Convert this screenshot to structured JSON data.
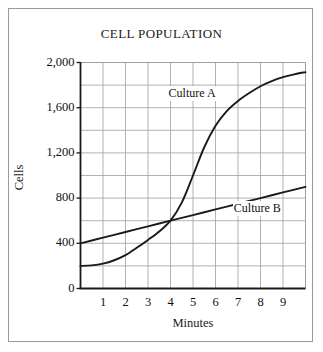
{
  "chart_data": {
    "type": "line",
    "title": "CELL POPULATION",
    "xlabel": "Minutes",
    "ylabel": "Cells",
    "xlim": [
      0,
      10
    ],
    "ylim": [
      0,
      2000
    ],
    "grid": true,
    "x_tick_labels": [
      "1",
      "2",
      "3",
      "4",
      "5",
      "6",
      "7",
      "8",
      "9"
    ],
    "x_tick_values": [
      1,
      2,
      3,
      4,
      5,
      6,
      7,
      8,
      9
    ],
    "x_gridline_values": [
      0,
      1,
      2,
      3,
      4,
      5,
      6,
      7,
      8,
      9,
      10
    ],
    "y_tick_labels": [
      "0",
      "400",
      "800",
      "1,200",
      "1,600",
      "2,000"
    ],
    "y_tick_values": [
      0,
      400,
      800,
      1200,
      1600,
      2000
    ],
    "y_gridline_values": [
      0,
      200,
      400,
      600,
      800,
      1000,
      1200,
      1400,
      1600,
      1800,
      2000
    ],
    "legend_position": "inline-annotation",
    "line_color": "#1a1a1a",
    "grid_color": "#9e9e9e",
    "axis_color": "#1a1a1a",
    "background_color": "#ffffff",
    "series": [
      {
        "name": "Culture A",
        "label_x": 5.05,
        "label_y": 1725,
        "x": [
          0,
          0.5,
          1,
          1.5,
          2,
          2.5,
          3,
          3.5,
          4,
          4.5,
          5,
          5.5,
          6,
          6.5,
          7,
          7.5,
          8,
          8.5,
          9,
          9.5,
          10
        ],
        "values": [
          200,
          205,
          220,
          250,
          295,
          360,
          430,
          505,
          600,
          760,
          1000,
          1250,
          1440,
          1570,
          1660,
          1730,
          1790,
          1835,
          1870,
          1895,
          1915
        ]
      },
      {
        "name": "Culture B",
        "label_x": 7.95,
        "label_y": 700,
        "x": [
          0,
          1,
          2,
          3,
          4,
          5,
          6,
          7,
          8,
          9,
          10
        ],
        "values": [
          400,
          450,
          500,
          550,
          600,
          650,
          700,
          750,
          800,
          850,
          900
        ]
      }
    ]
  }
}
